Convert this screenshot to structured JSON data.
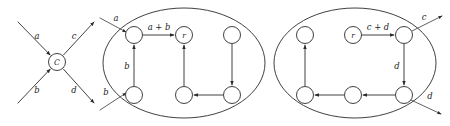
{
  "figure": {
    "type": "diagram",
    "background_color": "#ffffff",
    "ink_color": "#2b2b2b",
    "panels": [
      {
        "id": "panel-left",
        "name": "composite-node-panel",
        "kind": "node-with-ports",
        "center_node": {
          "label": "C",
          "cx": 57,
          "cy": 62,
          "r": 8.5
        },
        "edges": [
          {
            "label": "a",
            "direction": "in",
            "from": [
              18,
              22
            ],
            "to": [
              50,
              55
            ],
            "label_x": 37,
            "label_y": 36
          },
          {
            "label": "c",
            "direction": "out",
            "from": [
              64,
              55
            ],
            "to": [
              94,
              22
            ],
            "label_x": 74,
            "label_y": 36
          },
          {
            "label": "b",
            "direction": "in",
            "from": [
              18,
              103
            ],
            "to": [
              50,
              70
            ],
            "label_x": 37,
            "label_y": 90
          },
          {
            "label": "d",
            "direction": "out",
            "from": [
              64,
              70
            ],
            "to": [
              94,
              103
            ],
            "label_x": 74,
            "label_y": 90
          }
        ]
      },
      {
        "id": "panel-middle",
        "name": "cluster-ab-panel",
        "kind": "cluster",
        "boundary": {
          "cx": 184,
          "cy": 63,
          "rx": 81,
          "ry": 55
        },
        "nodes": [
          {
            "id": "m-tl",
            "label": "",
            "cx": 134,
            "cy": 35,
            "r": 8.5
          },
          {
            "id": "m-tm",
            "label": "r",
            "cx": 184,
            "cy": 35,
            "r": 8.5
          },
          {
            "id": "m-tr",
            "label": "",
            "cx": 232,
            "cy": 35,
            "r": 8.5
          },
          {
            "id": "m-bl",
            "label": "",
            "cx": 134,
            "cy": 95,
            "r": 8.5
          },
          {
            "id": "m-bm",
            "label": "",
            "cx": 184,
            "cy": 95,
            "r": 8.5
          },
          {
            "id": "m-br",
            "label": "",
            "cx": 232,
            "cy": 95,
            "r": 8.5
          }
        ],
        "internal_edges": [
          {
            "from": "m-tl",
            "to": "m-tm",
            "label": "a + b",
            "label_x": 159,
            "label_y": 27
          },
          {
            "from": "m-bl",
            "to": "m-tl",
            "label": "b",
            "label_x": 127,
            "label_y": 66
          },
          {
            "from": "m-bm",
            "to": "m-tm",
            "label": ""
          },
          {
            "from": "m-br",
            "to": "m-bm",
            "label": ""
          },
          {
            "from": "m-tr",
            "to": "m-br",
            "label": ""
          }
        ],
        "external_edges": [
          {
            "label": "a",
            "direction": "in",
            "from": [
              100,
              18
            ],
            "to": [
              126,
              32
            ],
            "label_x": 116,
            "label_y": 18
          },
          {
            "label": "b",
            "direction": "in",
            "from": [
              100,
              110
            ],
            "to": [
              126,
              93
            ],
            "label_x": 106,
            "label_y": 92
          }
        ]
      },
      {
        "id": "panel-right",
        "name": "cluster-cd-panel",
        "kind": "cluster",
        "boundary": {
          "cx": 355,
          "cy": 63,
          "rx": 81,
          "ry": 55
        },
        "nodes": [
          {
            "id": "r-tl",
            "label": "",
            "cx": 305,
            "cy": 35,
            "r": 8.5
          },
          {
            "id": "r-tm",
            "label": "r",
            "cx": 353,
            "cy": 35,
            "r": 8.5
          },
          {
            "id": "r-tr",
            "label": "",
            "cx": 404,
            "cy": 35,
            "r": 8.5
          },
          {
            "id": "r-bl",
            "label": "",
            "cx": 305,
            "cy": 95,
            "r": 8.5
          },
          {
            "id": "r-bm",
            "label": "",
            "cx": 353,
            "cy": 95,
            "r": 8.5
          },
          {
            "id": "r-br",
            "label": "",
            "cx": 404,
            "cy": 95,
            "r": 8.5
          }
        ],
        "internal_edges": [
          {
            "from": "r-tm",
            "to": "r-tr",
            "label": "c + d",
            "label_x": 378,
            "label_y": 27
          },
          {
            "from": "r-tr",
            "to": "r-br",
            "label": "d",
            "label_x": 397,
            "label_y": 66
          },
          {
            "from": "r-br",
            "to": "r-bm",
            "label": ""
          },
          {
            "from": "r-bm",
            "to": "r-bl",
            "label": ""
          },
          {
            "from": "r-bl",
            "to": "r-tl",
            "label": ""
          }
        ],
        "external_edges": [
          {
            "label": "c",
            "direction": "out",
            "from": [
              412,
              31
            ],
            "to": [
              442,
              16
            ],
            "label_x": 424,
            "label_y": 17
          },
          {
            "label": "d",
            "direction": "out",
            "from": [
              411,
              100
            ],
            "to": [
              441,
              114
            ],
            "label_x": 430,
            "label_y": 96
          }
        ]
      }
    ]
  }
}
